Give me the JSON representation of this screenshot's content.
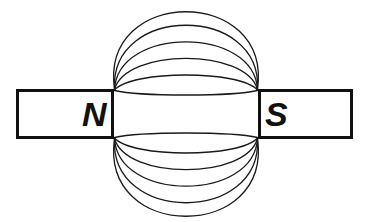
{
  "figure": {
    "background_color": "#ffffff",
    "width": 369,
    "height": 222
  },
  "magnets": {
    "left": {
      "name": "north-pole-magnet",
      "label": "N",
      "x": 16,
      "y": 89,
      "width": 98,
      "height": 50,
      "stroke_color": "#111111",
      "fill_color": "#ffffff",
      "stroke_width": 3,
      "label_x": 93,
      "label_y": 114
    },
    "right": {
      "name": "south-pole-magnet",
      "label": "S",
      "x": 258,
      "y": 89,
      "width": 95,
      "height": 50,
      "stroke_color": "#111111",
      "fill_color": "#ffffff",
      "stroke_width": 3,
      "label_x": 276,
      "label_y": 114
    }
  },
  "field": {
    "name": "magnetic-field-lines",
    "stroke_color": "#1a1a1a",
    "stroke_width": 1.3,
    "left_pole_face_x": 114,
    "right_pole_face_x": 258,
    "pole_face_top_y": 90,
    "pole_face_bottom_y": 138,
    "center_x": 186,
    "line_count": 12,
    "upper_arc_peaks": [
      92.5,
      74,
      56,
      40,
      26,
      13
    ],
    "lower_arc_peaks": [
      135.5,
      154,
      172,
      188,
      200,
      210
    ],
    "upper_start_y": [
      90.5,
      90,
      89.5,
      89.5,
      89,
      89
    ],
    "lower_start_y": [
      137.5,
      138,
      138.5,
      138.5,
      139,
      139
    ],
    "description": "Curved field lines leaving the N pole face and entering the S pole face, symmetric about the horizontal mid-line"
  }
}
